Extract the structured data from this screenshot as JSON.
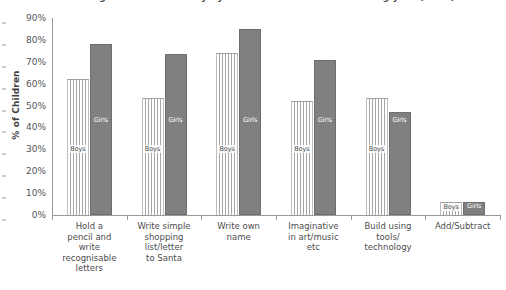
{
  "chart_data": {
    "type": "bar",
    "title": "Percentage of children ready by skill at start of their schooling year (2015)",
    "xlabel": "",
    "ylabel": "% of Children",
    "ylim": [
      0,
      90
    ],
    "ytick_labels": [
      "0%",
      "10%",
      "20%",
      "30%",
      "40%",
      "50%",
      "60%",
      "70%",
      "80%",
      "90%"
    ],
    "ytick_values": [
      0,
      10,
      20,
      30,
      40,
      50,
      60,
      70,
      80,
      90
    ],
    "grid": false,
    "legend_position": "in-bar-labels",
    "categories": [
      "Hold a pencil and write recognisable letters",
      "Write simple shopping list/letter to Santa",
      "Write own name",
      "Imaginative in art/music etc",
      "Build using tools/ technology",
      "Add/Subtract"
    ],
    "category_lines": [
      [
        "Hold a",
        "pencil and",
        "write",
        "recognisable",
        "letters"
      ],
      [
        "Write simple",
        "shopping",
        "list/letter",
        "to Santa"
      ],
      [
        "Write own",
        "name"
      ],
      [
        "Imaginative",
        "in art/music",
        "etc"
      ],
      [
        "Build using",
        "tools/",
        "technology"
      ],
      [
        "Add/Subtract"
      ]
    ],
    "series": [
      {
        "name": "Boys",
        "label": "Boys",
        "color": "#ffffff",
        "pattern": "vertical-stripes",
        "values": [
          62,
          53.5,
          74,
          52,
          53.5,
          6
        ]
      },
      {
        "name": "Girls",
        "label": "Girls",
        "color": "#808080",
        "pattern": "solid",
        "values": [
          78,
          73.5,
          85,
          71,
          47,
          6
        ]
      }
    ]
  }
}
